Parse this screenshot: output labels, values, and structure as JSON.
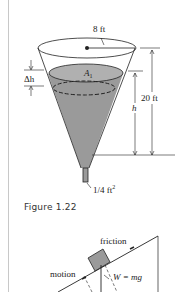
{
  "figure_top": {
    "labels": {
      "radius": "8 ft",
      "area": "A",
      "area_sub": "1",
      "delta_h": "Δh",
      "height_total": "20 ft",
      "height_h": "h",
      "outlet_area": "1/4 ft",
      "outlet_exp": "2"
    },
    "colors": {
      "liquid": "#9a9a9a",
      "liquid_top": "#b5b5b5",
      "stroke": "#222222"
    }
  },
  "caption": {
    "text": "Figure 1.22"
  },
  "figure_bottom": {
    "labels": {
      "friction": "friction",
      "motion": "motion",
      "weight": "W = mg"
    },
    "colors": {
      "block": "#9a9a9a",
      "stroke": "#222222"
    }
  }
}
